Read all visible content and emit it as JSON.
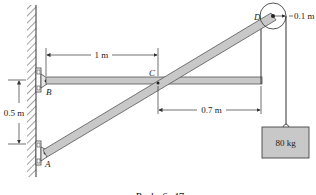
{
  "figure": {
    "caption": "Prob. 6–47",
    "points": {
      "A": "A",
      "B": "B",
      "C": "C",
      "D": "D"
    },
    "dimensions": {
      "bc_length": "1 m",
      "c_to_end": "0.7 m",
      "ab_height": "0.5 m",
      "pulley_radius": "0.1 m"
    },
    "load": {
      "mass_label": "80 kg"
    },
    "colors": {
      "member_fill": "#c8c8c8",
      "member_stroke": "#555555",
      "box_fill": "#c8c8c8",
      "line": "#333333"
    }
  }
}
